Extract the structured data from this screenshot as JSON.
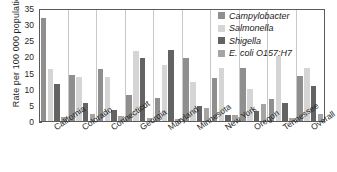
{
  "chart_data": {
    "type": "bar",
    "title": "",
    "xlabel": "",
    "ylabel": "Rate per 100 000 population",
    "ylim": [
      0,
      35
    ],
    "yticks": [
      0,
      5,
      10,
      15,
      20,
      25,
      30,
      35
    ],
    "grid": "vertical-separators",
    "legend_position": "top-right",
    "categories": [
      "California",
      "Colorado",
      "Connecticut",
      "Georgia",
      "Maryland",
      "Minnesota",
      "New York",
      "Oregon",
      "Tennessee",
      "Overall"
    ],
    "series": [
      {
        "name": "Campylobacter",
        "color": "#8f8f8f",
        "values": [
          32.0,
          14.3,
          16.0,
          8.0,
          7.2,
          19.5,
          13.4,
          16.4,
          6.9,
          13.8
        ]
      },
      {
        "name": "Salmonella",
        "color": "#d5d5d5",
        "values": [
          16.0,
          13.5,
          13.5,
          21.7,
          17.4,
          12.2,
          16.4,
          9.8,
          20.0,
          16.4
        ]
      },
      {
        "name": "Shigella",
        "color": "#636363",
        "values": [
          11.6,
          5.5,
          3.3,
          19.4,
          22.0,
          4.7,
          2.0,
          3.0,
          5.5,
          10.8
        ]
      },
      {
        "name": "E. coli O157:H7",
        "color": "#a5a5a5",
        "values": [
          1.2,
          2.3,
          1.6,
          1.0,
          0.7,
          3.9,
          1.9,
          5.2,
          1.0,
          2.3
        ]
      }
    ]
  },
  "legend": {
    "items": [
      {
        "label": "Campylobacter"
      },
      {
        "label": "Salmonella"
      },
      {
        "label": "Shigella"
      },
      {
        "label": "E. coli O157:H7"
      }
    ]
  }
}
